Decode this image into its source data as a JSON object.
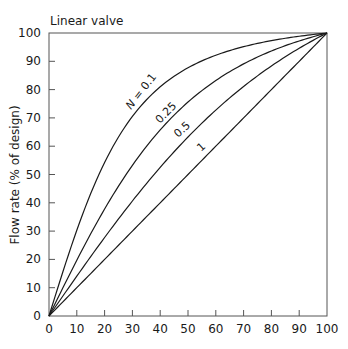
{
  "chart_data": {
    "type": "line",
    "title": "Linear valve",
    "xlabel": "",
    "ylabel": "Flow rate (% of design)",
    "xlim": [
      0,
      100
    ],
    "ylim": [
      0,
      100
    ],
    "grid": false,
    "x_ticks": [
      0,
      10,
      20,
      30,
      40,
      50,
      60,
      70,
      80,
      90,
      100
    ],
    "y_ticks": [
      0,
      10,
      20,
      30,
      40,
      50,
      60,
      70,
      80,
      90,
      100
    ],
    "x": [
      0,
      10,
      20,
      30,
      40,
      50,
      60,
      70,
      80,
      90,
      100
    ],
    "series": [
      {
        "name": "N = 0.1",
        "label": "N = 0.1",
        "values": [
          0,
          31,
          54,
          69,
          80,
          88,
          93,
          96,
          98,
          99,
          100
        ]
      },
      {
        "name": "0.25",
        "label": "0.25",
        "values": [
          0,
          20,
          38,
          53,
          65,
          76,
          84,
          90,
          95,
          98,
          100
        ]
      },
      {
        "name": "0.5",
        "label": "0.5",
        "values": [
          0,
          14,
          28,
          41,
          53,
          63,
          73,
          81,
          89,
          95,
          100
        ]
      },
      {
        "name": "1",
        "label": "1",
        "values": [
          0,
          10,
          20,
          30,
          40,
          50,
          60,
          70,
          80,
          90,
          100
        ]
      }
    ],
    "legend": "inline curve labels"
  }
}
